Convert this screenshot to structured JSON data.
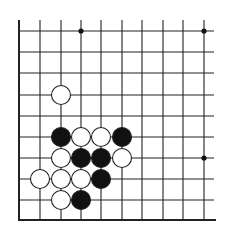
{
  "board": {
    "type": "go-diagram",
    "columns": 10,
    "rows": 10,
    "col_x": [
      19,
      40,
      61,
      81,
      101,
      122,
      142,
      163,
      183,
      204
    ],
    "row_y": [
      31,
      52,
      73,
      95,
      116,
      137,
      158,
      179,
      200,
      220
    ],
    "edges": {
      "left": true,
      "bottom": true,
      "top": false,
      "right": false
    },
    "extend": {
      "top_y": 20,
      "right_x": 214
    },
    "colors": {
      "line": "#222222",
      "black": "#111111",
      "white": "#ffffff",
      "background": "#ffffff"
    },
    "stone_radius": 9.5,
    "star_points": [
      {
        "col": 3,
        "row": 0
      },
      {
        "col": 9,
        "row": 0
      },
      {
        "col": 9,
        "row": 6
      }
    ],
    "stones": [
      {
        "color": "white",
        "col": 2,
        "row": 3
      },
      {
        "color": "black",
        "col": 2,
        "row": 5
      },
      {
        "color": "white",
        "col": 3,
        "row": 5
      },
      {
        "color": "white",
        "col": 4,
        "row": 5
      },
      {
        "color": "black",
        "col": 5,
        "row": 5
      },
      {
        "color": "white",
        "col": 2,
        "row": 6
      },
      {
        "color": "black",
        "col": 3,
        "row": 6
      },
      {
        "color": "black",
        "col": 4,
        "row": 6
      },
      {
        "color": "white",
        "col": 5,
        "row": 6
      },
      {
        "color": "white",
        "col": 1,
        "row": 7
      },
      {
        "color": "white",
        "col": 2,
        "row": 7
      },
      {
        "color": "white",
        "col": 3,
        "row": 7
      },
      {
        "color": "black",
        "col": 4,
        "row": 7
      },
      {
        "color": "white",
        "col": 2,
        "row": 8
      },
      {
        "color": "black",
        "col": 3,
        "row": 8
      }
    ]
  }
}
